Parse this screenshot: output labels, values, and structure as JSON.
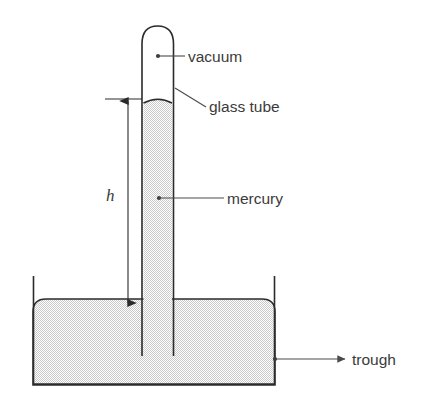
{
  "figure": {
    "background_color": "#ffffff",
    "outline_color": "#2b2b2b",
    "fill_color": "#d2d2d2",
    "label_color": "#3b3b3b",
    "leader_color": "#4a4a4a"
  },
  "labels": {
    "vacuum": "vacuum",
    "glass_tube": "glass tube",
    "mercury": "mercury",
    "trough": "trough",
    "height": "h"
  },
  "parts": {
    "vacuum_region": "vacuum",
    "tube": "glass tube",
    "liquid": "mercury",
    "vessel": "trough",
    "height_dimension": "h"
  }
}
